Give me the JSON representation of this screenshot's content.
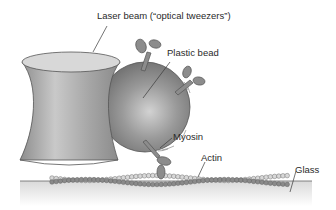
{
  "figure": {
    "labels": {
      "laser_beam": "Laser beam (“optical tweezers”)",
      "plastic_bead": "Plastic bead",
      "myosin": "Myosin",
      "actin": "Actin",
      "glass": "Glass"
    },
    "colors": {
      "background": "#ffffff",
      "beam": "#9a9a9a",
      "beam_top": "#d6d6d6",
      "bead": "#8a8a8a",
      "myosin": "#8c8c8c",
      "actin_dark": "#8a8a8a",
      "actin_light": "#d8d8d8",
      "glass": "#ececec",
      "leader_lines": "#3a3a3a"
    },
    "components": [
      "laser-beam",
      "plastic-bead",
      "myosin-molecules",
      "actin-filament",
      "glass-surface"
    ]
  }
}
